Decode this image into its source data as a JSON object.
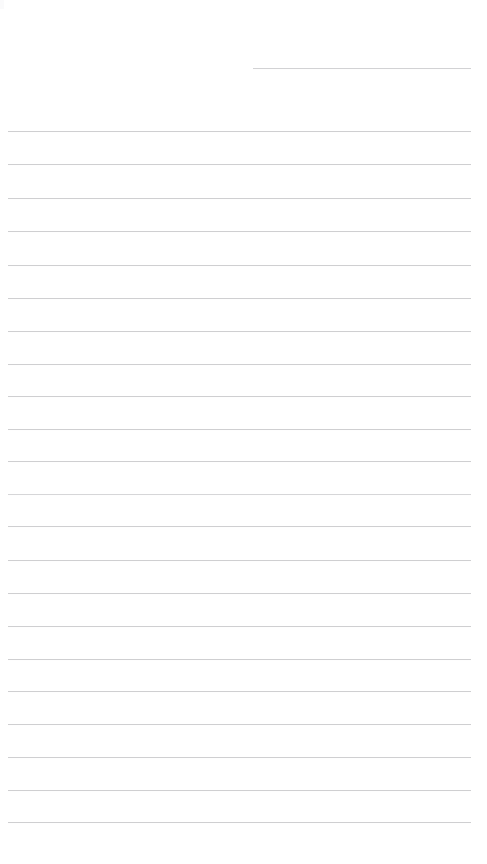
{
  "page": {
    "kind": "blank-ruled-notebook-page",
    "width_px": 487,
    "height_px": 864,
    "background_color": "#ffffff",
    "rule_color": "#cfcfd1",
    "rule_thickness_px": 1,
    "rule_spacing_px": 32.4,
    "rule_count": 23,
    "text_content": "",
    "margin": {
      "left_px": 8,
      "right_px": 470,
      "top_first_rule_px": 68,
      "bottom_last_rule_px": 822,
      "has_vertical_margin_rule": false,
      "has_punch_holes": false
    },
    "rules": [
      {
        "index": 1,
        "y": 68,
        "x_start": 253,
        "x_end": 471,
        "style": "short"
      },
      {
        "index": 2,
        "y": 131,
        "x_start": 8,
        "x_end": 471,
        "style": "full"
      },
      {
        "index": 3,
        "y": 164,
        "x_start": 8,
        "x_end": 471,
        "style": "full"
      },
      {
        "index": 4,
        "y": 198,
        "x_start": 8,
        "x_end": 471,
        "style": "full"
      },
      {
        "index": 5,
        "y": 231,
        "x_start": 8,
        "x_end": 471,
        "style": "full"
      },
      {
        "index": 6,
        "y": 265,
        "x_start": 8,
        "x_end": 471,
        "style": "full"
      },
      {
        "index": 7,
        "y": 298,
        "x_start": 8,
        "x_end": 471,
        "style": "full"
      },
      {
        "index": 8,
        "y": 331,
        "x_start": 8,
        "x_end": 471,
        "style": "full"
      },
      {
        "index": 9,
        "y": 364,
        "x_start": 8,
        "x_end": 471,
        "style": "full"
      },
      {
        "index": 10,
        "y": 396,
        "x_start": 8,
        "x_end": 471,
        "style": "full"
      },
      {
        "index": 11,
        "y": 429,
        "x_start": 8,
        "x_end": 471,
        "style": "full"
      },
      {
        "index": 12,
        "y": 461,
        "x_start": 8,
        "x_end": 471,
        "style": "full"
      },
      {
        "index": 13,
        "y": 494,
        "x_start": 8,
        "x_end": 471,
        "style": "faint"
      },
      {
        "index": 14,
        "y": 526,
        "x_start": 8,
        "x_end": 471,
        "style": "full"
      },
      {
        "index": 15,
        "y": 560,
        "x_start": 8,
        "x_end": 471,
        "style": "full"
      },
      {
        "index": 16,
        "y": 593,
        "x_start": 8,
        "x_end": 471,
        "style": "full"
      },
      {
        "index": 17,
        "y": 626,
        "x_start": 8,
        "x_end": 471,
        "style": "full"
      },
      {
        "index": 18,
        "y": 659,
        "x_start": 8,
        "x_end": 471,
        "style": "full"
      },
      {
        "index": 19,
        "y": 691,
        "x_start": 8,
        "x_end": 471,
        "style": "full"
      },
      {
        "index": 20,
        "y": 724,
        "x_start": 8,
        "x_end": 471,
        "style": "full"
      },
      {
        "index": 21,
        "y": 757,
        "x_start": 8,
        "x_end": 471,
        "style": "full"
      },
      {
        "index": 22,
        "y": 790,
        "x_start": 8,
        "x_end": 471,
        "style": "full"
      },
      {
        "index": 23,
        "y": 822,
        "x_start": 8,
        "x_end": 471,
        "style": "full"
      }
    ]
  }
}
